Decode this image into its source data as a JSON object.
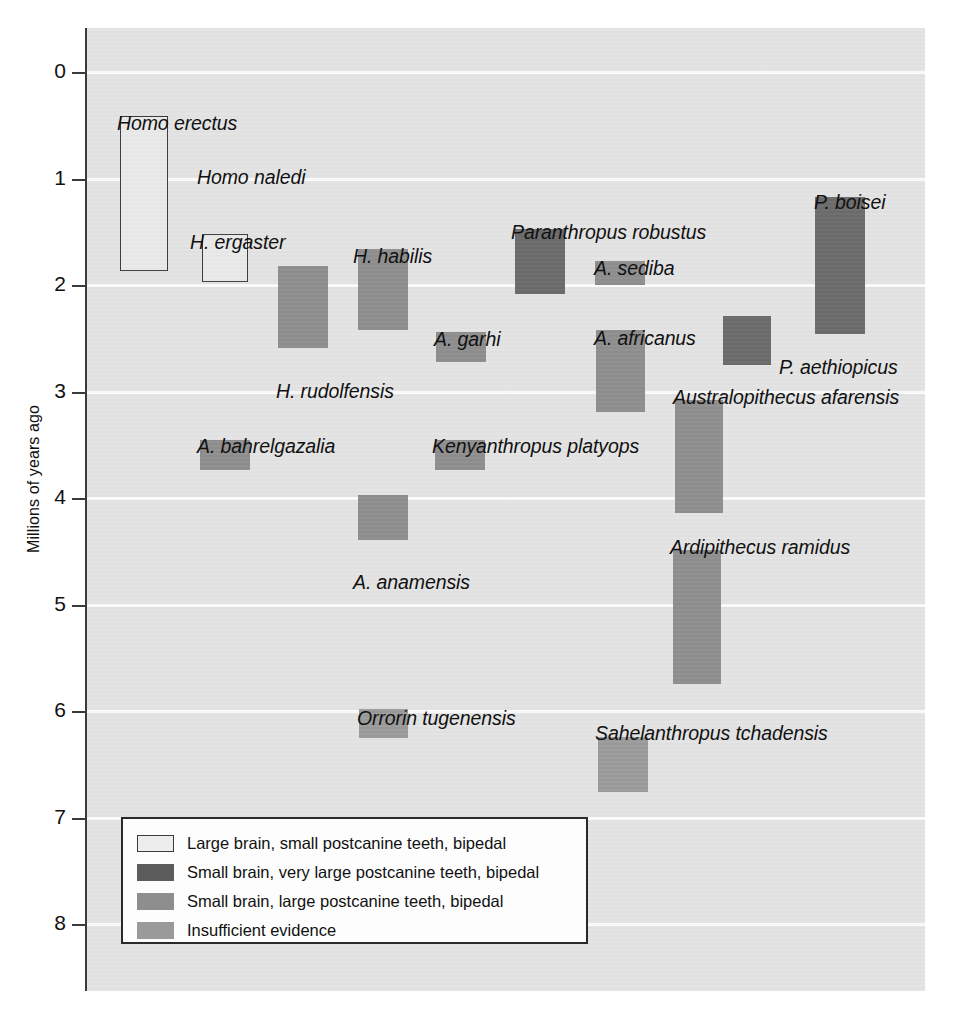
{
  "chart_data": {
    "type": "bar",
    "orientation": "vertical-ranges",
    "title": "",
    "xlabel": "",
    "ylabel": "Millions of years ago",
    "ylim": [
      0,
      8
    ],
    "y_axis_inverted": true,
    "grid": true,
    "y_ticks": [
      "0",
      "1",
      "2",
      "3",
      "4",
      "5",
      "6",
      "7",
      "8"
    ],
    "y_tick_values": [
      0,
      1,
      2,
      3,
      4,
      5,
      6,
      7,
      8
    ],
    "legend_position": "inside-bottom-left",
    "categories": [
      "Homo erectus",
      "Homo naledi",
      "H. ergaster",
      "H. rudolfensis",
      "H. habilis",
      "A. garhi",
      "Paranthropus robustus",
      "A. sediba",
      "A. africanus",
      "P. boisei",
      "P. aethiopicus",
      "A. bahrelgazalia",
      "Kenyanthropus platyops",
      "Australopithecus afarensis",
      "A. anamensis",
      "Ardipithecus ramidus",
      "Orrorin tugenensis",
      "Sahelanthropus tchadensis"
    ],
    "series": [
      {
        "name": "Large brain, small postcanine teeth, bipedal",
        "color": "#e9e9e9",
        "bars": [
          {
            "label": "Homo erectus",
            "start_mya": 1.87,
            "end_mya": 0.41
          },
          {
            "label": "H. ergaster",
            "start_mya": 1.97,
            "end_mya": 1.52
          }
        ]
      },
      {
        "name": "Small brain, very large postcanine teeth, bipedal",
        "color": "#6b6b6b",
        "bars": [
          {
            "label": "Paranthropus robustus",
            "start_mya": 2.08,
            "end_mya": 1.47
          },
          {
            "label": "P. boisei",
            "start_mya": 2.46,
            "end_mya": 1.17
          },
          {
            "label": "P. aethiopicus",
            "start_mya": 2.75,
            "end_mya": 2.29
          }
        ]
      },
      {
        "name": "Small brain, large postcanine teeth, bipedal",
        "color": "#8e8e8e",
        "bars": [
          {
            "label": "H. rudolfensis",
            "start_mya": 2.59,
            "end_mya": 1.82
          },
          {
            "label": "H. habilis",
            "start_mya": 2.42,
            "end_mya": 1.66
          },
          {
            "label": "A. garhi",
            "start_mya": 2.72,
            "end_mya": 2.44
          },
          {
            "label": "A. sediba",
            "start_mya": 2.0,
            "end_mya": 1.77
          },
          {
            "label": "A. africanus",
            "start_mya": 3.19,
            "end_mya": 2.42
          },
          {
            "label": "A. bahrelgazalia",
            "start_mya": 3.74,
            "end_mya": 3.46
          },
          {
            "label": "Kenyanthropus platyops",
            "start_mya": 3.74,
            "end_mya": 3.46
          },
          {
            "label": "Australopithecus afarensis",
            "start_mya": 4.14,
            "end_mya": 3.08
          },
          {
            "label": "A. anamensis",
            "start_mya": 4.39,
            "end_mya": 3.97
          },
          {
            "label": "Ardipithecus ramidus",
            "start_mya": 5.75,
            "end_mya": 4.49
          }
        ]
      },
      {
        "name": "Insufficient evidence",
        "color": "#9a9a9a",
        "bars": [
          {
            "label": "Orrorin tugenensis",
            "start_mya": 6.25,
            "end_mya": 5.98
          },
          {
            "label": "Sahelanthropus tchadensis",
            "start_mya": 6.76,
            "end_mya": 6.24
          }
        ]
      }
    ],
    "unlabeled_taxa": [
      "Homo naledi"
    ],
    "annotations": [
      {
        "text": "Homo naledi",
        "note": "label present without a drawn range bar"
      }
    ]
  },
  "axis": {
    "y_label": "Millions of years ago",
    "ticks": [
      "0",
      "1",
      "2",
      "3",
      "4",
      "5",
      "6",
      "7",
      "8"
    ]
  },
  "bars": [
    {
      "id": "homo-erectus",
      "label": "Homo erectus",
      "category": "cat-large-brain",
      "x": 33,
      "w": 48,
      "top_mya": 0.41,
      "bottom_mya": 1.87
    },
    {
      "id": "h-ergaster",
      "label": "H. ergaster",
      "category": "cat-large-brain",
      "x": 115,
      "w": 46,
      "top_mya": 1.52,
      "bottom_mya": 1.97
    },
    {
      "id": "h-rudolfensis",
      "label": "H. rudolfensis",
      "category": "cat-large-teeth",
      "x": 191,
      "w": 50,
      "top_mya": 1.82,
      "bottom_mya": 2.59
    },
    {
      "id": "h-habilis",
      "label": "H. habilis",
      "category": "cat-large-teeth",
      "x": 271,
      "w": 50,
      "top_mya": 1.66,
      "bottom_mya": 2.42
    },
    {
      "id": "a-garhi",
      "label": "A. garhi",
      "category": "cat-large-teeth",
      "x": 349,
      "w": 50,
      "top_mya": 2.44,
      "bottom_mya": 2.72
    },
    {
      "id": "paranthropus-robustus",
      "label": "Paranthropus robustus",
      "category": "cat-very-large-teeth",
      "x": 428,
      "w": 50,
      "top_mya": 1.47,
      "bottom_mya": 2.08
    },
    {
      "id": "a-sediba",
      "label": "A. sediba",
      "category": "cat-large-teeth",
      "x": 508,
      "w": 50,
      "top_mya": 1.77,
      "bottom_mya": 2.0
    },
    {
      "id": "a-africanus",
      "label": "A. africanus",
      "category": "cat-large-teeth",
      "x": 509,
      "w": 49,
      "top_mya": 2.42,
      "bottom_mya": 3.19
    },
    {
      "id": "p-aethiopicus",
      "label": "P. aethiopicus",
      "category": "cat-very-large-teeth",
      "x": 636,
      "w": 48,
      "top_mya": 2.29,
      "bottom_mya": 2.75
    },
    {
      "id": "p-boisei",
      "label": "P. boisei",
      "category": "cat-very-large-teeth",
      "x": 728,
      "w": 50,
      "top_mya": 1.17,
      "bottom_mya": 2.46
    },
    {
      "id": "a-bahrelgazalia",
      "label": "A. bahrelgazalia",
      "category": "cat-large-teeth",
      "x": 113,
      "w": 50,
      "top_mya": 3.46,
      "bottom_mya": 3.74
    },
    {
      "id": "kenyanthropus-platyops",
      "label": "Kenyanthropus platyops",
      "category": "cat-large-teeth",
      "x": 348,
      "w": 50,
      "top_mya": 3.46,
      "bottom_mya": 3.74
    },
    {
      "id": "a-anamensis",
      "label": "A. anamensis",
      "category": "cat-large-teeth",
      "x": 271,
      "w": 50,
      "top_mya": 3.97,
      "bottom_mya": 4.39
    },
    {
      "id": "australopithecus-afarensis",
      "label": "Australopithecus afarensis",
      "category": "cat-large-teeth",
      "x": 588,
      "w": 48,
      "top_mya": 3.08,
      "bottom_mya": 4.14
    },
    {
      "id": "ardipithecus-ramidus",
      "label": "Ardipithecus ramidus",
      "category": "cat-large-teeth",
      "x": 586,
      "w": 48,
      "top_mya": 4.49,
      "bottom_mya": 5.75
    },
    {
      "id": "orrorin-tugenensis",
      "label": "Orrorin tugenensis",
      "category": "cat-insufficient",
      "x": 272,
      "w": 49,
      "top_mya": 5.98,
      "bottom_mya": 6.25
    },
    {
      "id": "sahelanthropus-tchadensis",
      "label": "Sahelanthropus tchadensis",
      "category": "cat-insufficient",
      "x": 511,
      "w": 50,
      "top_mya": 6.24,
      "bottom_mya": 6.76
    }
  ],
  "bar_labels": [
    {
      "id": "homo-erectus",
      "text": "Homo erectus",
      "x": 30,
      "y": 84
    },
    {
      "id": "homo-naledi",
      "text": "Homo naledi",
      "x": 110,
      "y": 138
    },
    {
      "id": "h-ergaster",
      "text": "H. ergaster",
      "x": 103,
      "y": 203
    },
    {
      "id": "h-habilis",
      "text": "H. habilis",
      "x": 266,
      "y": 217
    },
    {
      "id": "paranthropus-robustus",
      "text": "Paranthropus robustus",
      "x": 424,
      "y": 193
    },
    {
      "id": "a-sediba",
      "text": "A. sediba",
      "x": 507,
      "y": 229
    },
    {
      "id": "p-boisei",
      "text": "P. boisei",
      "x": 727,
      "y": 163
    },
    {
      "id": "h-rudolfensis",
      "text": "H. rudolfensis",
      "x": 189,
      "y": 352
    },
    {
      "id": "a-garhi",
      "text": "A. garhi",
      "x": 347,
      "y": 300
    },
    {
      "id": "a-africanus",
      "text": "A. africanus",
      "x": 507,
      "y": 299
    },
    {
      "id": "p-aethiopicus",
      "text": "P. aethiopicus",
      "x": 692,
      "y": 328
    },
    {
      "id": "australopithecus-afarensis",
      "text": "Australopithecus afarensis",
      "x": 586,
      "y": 358
    },
    {
      "id": "a-bahrelgazalia",
      "text": "A. bahrelgazalia",
      "x": 110,
      "y": 407
    },
    {
      "id": "kenyanthropus-platyops",
      "text": "Kenyanthropus platyops",
      "x": 345,
      "y": 407
    },
    {
      "id": "a-anamensis",
      "text": "A. anamensis",
      "x": 266,
      "y": 543
    },
    {
      "id": "ardipithecus-ramidus",
      "text": "Ardipithecus ramidus",
      "x": 583,
      "y": 508
    },
    {
      "id": "orrorin-tugenensis",
      "text": "Orrorin tugenensis",
      "x": 270,
      "y": 679
    },
    {
      "id": "sahelanthropus-tchadensis",
      "text": "Sahelanthropus tchadensis",
      "x": 508,
      "y": 694
    }
  ],
  "legend": {
    "items": [
      {
        "category": "cat-large-brain",
        "label": "Large brain, small postcanine teeth, bipedal"
      },
      {
        "category": "cat-very-large-teeth",
        "label": "Small brain, very large postcanine teeth, bipedal"
      },
      {
        "category": "cat-large-teeth",
        "label": "Small brain, large postcanine teeth, bipedal"
      },
      {
        "category": "cat-insufficient",
        "label": "Insufficient evidence"
      }
    ]
  },
  "colors": {
    "plot_background": "#e3e3e3",
    "gridline": "#fbfbfb",
    "axis": "#3a3a3a",
    "large_brain": "#e9e9e9",
    "very_large_teeth": "#6b6b6b",
    "large_teeth": "#8e8e8e",
    "insufficient": "#9a9a9a"
  }
}
